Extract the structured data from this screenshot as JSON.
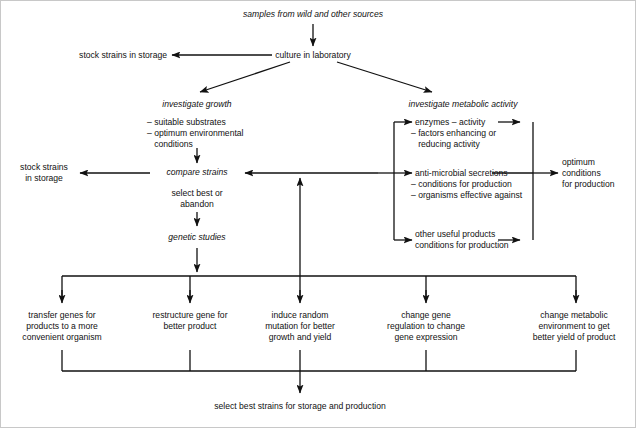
{
  "diagram": {
    "title": "samples from wild and other sources",
    "nodes": {
      "samples": "samples from wild and other sources",
      "culture": "culture in laboratory",
      "stock_top": "stock strains in storage",
      "investigate_growth": "investigate growth",
      "growth_items": [
        "– suitable substrates",
        "– optimum environmental",
        "   conditions"
      ],
      "compare_strains": "compare strains",
      "stock_left_line1": "stock strains",
      "stock_left_line2": "in storage",
      "select_best_line1": "select best or",
      "select_best_line2": "abandon",
      "genetic_studies": "genetic studies",
      "investigate_metabolic": "investigate metabolic activity",
      "enzymes_line1": "enzymes – activity",
      "enzymes_line2": "– factors enhancing or",
      "enzymes_line3": "   reducing activity",
      "antimicrobial_line1": "anti-microbial secretions",
      "antimicrobial_line2": "– conditions for production",
      "antimicrobial_line3": "– organisms effective against",
      "other_line1": "other useful products",
      "other_line2": "conditions for production",
      "optimum_line1": "optimum",
      "optimum_line2": "conditions",
      "optimum_line3": "for production",
      "final": "select best strains for storage and production"
    },
    "branches": [
      {
        "id": "transfer-genes",
        "lines": [
          "transfer genes for",
          "products to a more",
          "convenient organism"
        ]
      },
      {
        "id": "restructure-gene",
        "lines": [
          "restructure gene for",
          "better product",
          ""
        ]
      },
      {
        "id": "induce-mutation",
        "lines": [
          "induce random",
          "mutation for better",
          "growth and yield"
        ]
      },
      {
        "id": "change-regulation",
        "lines": [
          "change gene",
          "regulation to change",
          "gene expression"
        ]
      },
      {
        "id": "change-metabolic",
        "lines": [
          "change metabolic",
          "environment to get",
          "better yield of product"
        ]
      }
    ],
    "colors": {
      "line": "#111111",
      "text": "#111111",
      "background": "#ffffff",
      "frame": "#c8c8c8"
    }
  }
}
